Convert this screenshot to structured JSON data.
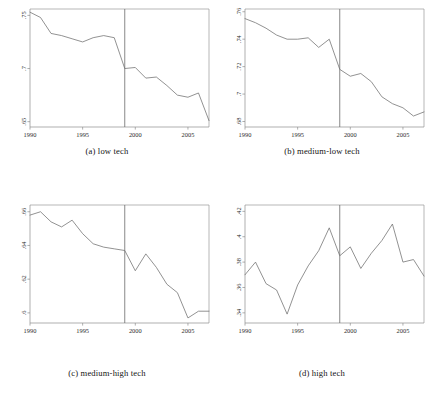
{
  "figure": {
    "panels": [
      {
        "id": "a",
        "caption": "(a) low tech",
        "xticks": [
          "1990",
          "1995",
          "2000",
          "2005"
        ],
        "yticks": [
          ".75",
          ".7",
          ".65"
        ]
      },
      {
        "id": "b",
        "caption": "(b) medium-low tech",
        "xticks": [
          "1990",
          "1995",
          "2000",
          "2005"
        ],
        "yticks": [
          ".76",
          ".74",
          ".72",
          ".7",
          ".68"
        ]
      },
      {
        "id": "c",
        "caption": "(c) medium-high tech",
        "xticks": [
          "1990",
          "1995",
          "2000",
          "2005"
        ],
        "yticks": [
          ".66",
          ".64",
          ".62",
          ".6"
        ]
      },
      {
        "id": "d",
        "caption": "(d) high tech",
        "xticks": [
          "1990",
          "1995",
          "2000",
          "2005"
        ],
        "yticks": [
          ".42",
          ".4",
          ".38",
          ".36",
          ".34"
        ]
      }
    ]
  },
  "chart_data": [
    {
      "type": "line",
      "title": "(a) low tech",
      "xlabel": "",
      "ylabel": "",
      "xlim": [
        1990,
        2007
      ],
      "ylim": [
        0.645,
        0.756
      ],
      "grid": false,
      "legend": false,
      "xticks": [
        1990,
        1995,
        2000,
        2005
      ],
      "ytick_values": [
        0.75,
        0.7,
        0.65
      ],
      "ytick_labels": [
        ".75",
        ".7",
        ".65"
      ],
      "annotations": [
        {
          "type": "vline",
          "x": 1999,
          "label": ""
        }
      ],
      "x": [
        1990,
        1991,
        1992,
        1993,
        1994,
        1995,
        1996,
        1997,
        1998,
        1999,
        2000,
        2001,
        2002,
        2003,
        2004,
        2005,
        2006,
        2007
      ],
      "values": [
        0.753,
        0.748,
        0.733,
        0.731,
        0.728,
        0.725,
        0.729,
        0.731,
        0.729,
        0.7,
        0.701,
        0.691,
        0.692,
        0.684,
        0.675,
        0.673,
        0.677,
        0.651
      ]
    },
    {
      "type": "line",
      "title": "(b) medium-low tech",
      "xlabel": "",
      "ylabel": "",
      "xlim": [
        1990,
        2007
      ],
      "ylim": [
        0.676,
        0.762
      ],
      "grid": false,
      "legend": false,
      "xticks": [
        1990,
        1995,
        2000,
        2005
      ],
      "ytick_values": [
        0.76,
        0.74,
        0.72,
        0.7,
        0.68
      ],
      "ytick_labels": [
        ".76",
        ".74",
        ".72",
        ".7",
        ".68"
      ],
      "annotations": [
        {
          "type": "vline",
          "x": 1999,
          "label": ""
        }
      ],
      "x": [
        1990,
        1991,
        1992,
        1993,
        1994,
        1995,
        1996,
        1997,
        1998,
        1999,
        2000,
        2001,
        2002,
        2003,
        2004,
        2005,
        2006,
        2007
      ],
      "values": [
        0.755,
        0.752,
        0.748,
        0.743,
        0.74,
        0.74,
        0.741,
        0.734,
        0.74,
        0.718,
        0.713,
        0.715,
        0.709,
        0.698,
        0.693,
        0.69,
        0.684,
        0.687
      ]
    },
    {
      "type": "line",
      "title": "(c) medium-high tech",
      "xlabel": "",
      "ylabel": "",
      "xlim": [
        1990,
        2007
      ],
      "ylim": [
        0.594,
        0.664
      ],
      "grid": false,
      "legend": false,
      "xticks": [
        1990,
        1995,
        2000,
        2005
      ],
      "ytick_values": [
        0.66,
        0.64,
        0.62,
        0.6
      ],
      "ytick_labels": [
        ".66",
        ".64",
        ".62",
        ".6"
      ],
      "annotations": [
        {
          "type": "vline",
          "x": 1999,
          "label": ""
        }
      ],
      "x": [
        1990,
        1991,
        1992,
        1993,
        1994,
        1995,
        1996,
        1997,
        1998,
        1999,
        2000,
        2001,
        2002,
        2003,
        2004,
        2005,
        2006,
        2007
      ],
      "values": [
        0.658,
        0.66,
        0.654,
        0.651,
        0.655,
        0.647,
        0.641,
        0.639,
        0.638,
        0.637,
        0.625,
        0.635,
        0.627,
        0.617,
        0.612,
        0.597,
        0.601,
        0.601
      ]
    },
    {
      "type": "line",
      "title": "(d) high tech",
      "xlabel": "",
      "ylabel": "",
      "xlim": [
        1990,
        2007
      ],
      "ylim": [
        0.332,
        0.425
      ],
      "grid": false,
      "legend": false,
      "xticks": [
        1990,
        1995,
        2000,
        2005
      ],
      "ytick_values": [
        0.42,
        0.4,
        0.38,
        0.36,
        0.34
      ],
      "ytick_labels": [
        ".42",
        ".4",
        ".38",
        ".36",
        ".34"
      ],
      "annotations": [
        {
          "type": "vline",
          "x": 1999,
          "label": ""
        }
      ],
      "x": [
        1990,
        1991,
        1992,
        1993,
        1994,
        1995,
        1996,
        1997,
        1998,
        1999,
        2000,
        2001,
        2002,
        2003,
        2004,
        2005,
        2006,
        2007
      ],
      "values": [
        0.37,
        0.38,
        0.363,
        0.358,
        0.339,
        0.362,
        0.377,
        0.389,
        0.407,
        0.385,
        0.392,
        0.375,
        0.387,
        0.397,
        0.41,
        0.38,
        0.382,
        0.369
      ]
    }
  ]
}
